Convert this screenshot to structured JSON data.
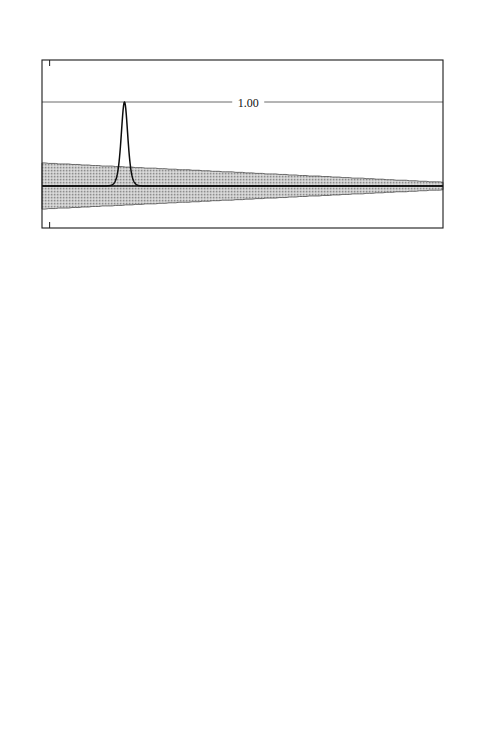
{
  "figure": {
    "axis_x_label": "X",
    "axis_y_label": "U",
    "band_label": "S",
    "velocity_label": "V",
    "xlim": [
      -2,
      103
    ],
    "ylim": [
      -0.5,
      1.5
    ],
    "xticks": [
      0,
      10,
      20,
      30,
      40,
      50,
      60,
      70,
      80,
      90,
      100
    ],
    "yticks": [
      -0.5,
      0.5,
      1.5
    ],
    "xtick_labels": [
      "0",
      "10",
      "20",
      "30",
      "40",
      "50",
      "60",
      "70",
      "80",
      "90",
      "100"
    ],
    "ytick_labels": [
      "-0.5",
      "0.5",
      "1.5"
    ],
    "ink_color": "#1b1b1b",
    "band_fill_color": "#c9c9c9",
    "level_line_color": "#5a5a5a"
  },
  "chart_data": {
    "type": "line",
    "title": "",
    "xlabel": "X",
    "ylabel": "U",
    "xlim": [
      -2,
      103
    ],
    "ylim": [
      -0.5,
      1.5
    ],
    "xticks": [
      0,
      10,
      20,
      30,
      40,
      50,
      60,
      70,
      80,
      90,
      100
    ],
    "yticks": [
      -0.5,
      0.5,
      1.5
    ],
    "grid": false,
    "legend": "none",
    "panels": [
      {
        "id": "I",
        "id_x": 91,
        "amplitude_label": "1.00",
        "amplitude": 1.0,
        "level_label_x": 52,
        "peak_center": 19.6,
        "peak_width": 1.15,
        "arrow_x_start": 25,
        "arrow_x_end": 37,
        "arrow_y": 0.78,
        "velocity_label_x": 28.5,
        "velocity_label_y": 0.56,
        "band_label_x": 6,
        "band_label_y": 0.12,
        "band_left_half_width": 0.275,
        "band_right_half_width": 0.045,
        "band_top_offset": 0.0,
        "series_name": "soliton-pulse-I"
      },
      {
        "id": "II",
        "id_x": 91,
        "amplitude_label": "1.08",
        "amplitude": 1.08,
        "level_label_x": 60,
        "peak_center": 41.0,
        "peak_width": 0.78,
        "arrow_x_start": 46,
        "arrow_x_end": 58,
        "arrow_y": 0.82,
        "velocity_label_x": 49.5,
        "velocity_label_y": 0.6,
        "band_label_x": 6,
        "band_label_y": 0.12,
        "band_left_half_width": 0.27,
        "band_right_half_width": 0.07,
        "band_top_offset": 0.0,
        "series_name": "soliton-pulse-II"
      },
      {
        "id": "III",
        "id_x": 83,
        "amplitude_label": "1.47",
        "amplitude": 1.47,
        "level_label_x": 71,
        "peak_center": 94.0,
        "peak_width": 0.52,
        "arrow_x_start": 97,
        "arrow_x_end": 104,
        "arrow_y": 1.02,
        "velocity_label_x": 99,
        "velocity_label_y": 0.8,
        "band_label_x": 6,
        "band_label_y": 0.12,
        "band_left_half_width": 0.27,
        "band_right_half_width": 0.055,
        "band_top_offset": 0.0,
        "series_name": "soliton-pulse-III"
      }
    ]
  }
}
